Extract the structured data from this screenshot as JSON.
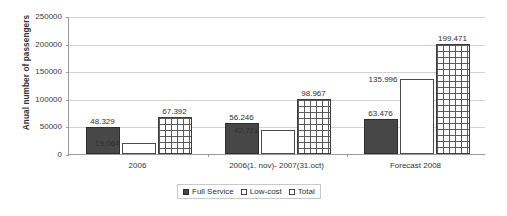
{
  "chart_data": {
    "type": "bar",
    "title": "",
    "xlabel": "",
    "ylabel": "Anual number of passengers",
    "ylim": [
      0,
      250000
    ],
    "grid": true,
    "legend_position": "bottom",
    "categories": [
      "2006",
      "2006(1. nov)- 2007(31.oct)",
      "Forecast 2008"
    ],
    "y_ticks": [
      "0",
      "50000",
      "100000",
      "150000",
      "200000",
      "250000"
    ],
    "y_tick_values": [
      0,
      50000,
      100000,
      150000,
      200000,
      250000
    ],
    "series": [
      {
        "name": "Full Service",
        "values": [
          48329,
          56246,
          63476
        ],
        "labels": [
          "48.329",
          "56.246",
          "63.476"
        ],
        "color": "#474747",
        "pattern": "solid"
      },
      {
        "name": "Low-cost",
        "values": [
          19064,
          42721,
          135996
        ],
        "labels": [
          "19.064",
          "42.721",
          "135.996"
        ],
        "color": "#ffffff",
        "pattern": "empty"
      },
      {
        "name": "Total",
        "values": [
          67392,
          98967,
          199471
        ],
        "labels": [
          "67.392",
          "98.967",
          "199.471"
        ],
        "color": "#ffffff",
        "pattern": "grid"
      }
    ]
  },
  "legend": {
    "items": [
      {
        "label": "Full Service"
      },
      {
        "label": "Low-cost"
      },
      {
        "label": "Total"
      }
    ]
  }
}
